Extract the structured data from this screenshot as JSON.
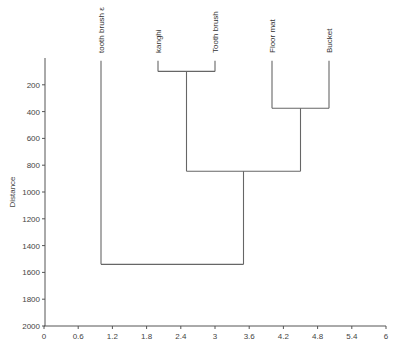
{
  "chart_data": {
    "type": "dendrogram",
    "title": "",
    "xlabel": "",
    "ylabel": "Distance",
    "xlim": [
      0,
      6
    ],
    "ylim": [
      0,
      2000
    ],
    "y_inverted": true,
    "x_ticks": [
      "0",
      "0.6",
      "1.2",
      "1.8",
      "2.4",
      "3",
      "3.6",
      "4.2",
      "4.8",
      "5.4",
      "6"
    ],
    "y_ticks": [
      "200",
      "400",
      "600",
      "800",
      "1000",
      "1200",
      "1400",
      "1600",
      "1800",
      "2000"
    ],
    "grid": false,
    "leaves": [
      {
        "label": "tooth brush ε",
        "x": 1
      },
      {
        "label": "kanghi",
        "x": 2
      },
      {
        "label": "Tooth brush",
        "x": 3
      },
      {
        "label": "Floor mat",
        "x": 4
      },
      {
        "label": "Bucket",
        "x": 5
      }
    ],
    "merges": [
      {
        "left_x": 2,
        "right_x": 3,
        "height": 100,
        "result_x": 2.5,
        "members": [
          "kanghi",
          "Tooth brush"
        ]
      },
      {
        "left_x": 4,
        "right_x": 5,
        "height": 375,
        "result_x": 4.5,
        "members": [
          "Floor mat",
          "Bucket"
        ]
      },
      {
        "left_x": 2.5,
        "right_x": 4.5,
        "height": 845,
        "result_x": 3.5,
        "members": [
          "kanghi",
          "Tooth brush",
          "Floor mat",
          "Bucket"
        ]
      },
      {
        "left_x": 1,
        "right_x": 3.5,
        "height": 1540,
        "result_x": 2.25,
        "members": [
          "tooth brush ε",
          "kanghi",
          "Tooth brush",
          "Floor mat",
          "Bucket"
        ]
      }
    ],
    "leaf_top": 20
  },
  "colors": {
    "axis": "#555555",
    "lines": "#666666",
    "text": "#444444"
  }
}
